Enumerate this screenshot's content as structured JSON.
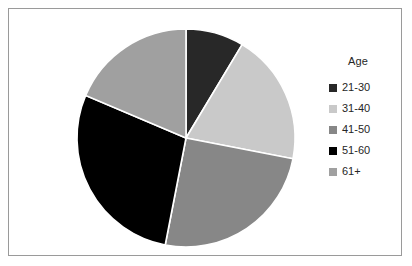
{
  "chart_data": {
    "type": "pie",
    "title": "",
    "legend_title": "Age",
    "legend_position": "right",
    "grid": false,
    "categories": [
      "21-30",
      "31-40",
      "41-50",
      "51-60",
      "61+"
    ],
    "values": [
      8.6,
      19.4,
      25.0,
      28.4,
      18.6
    ],
    "value_unit": "percent",
    "angles_deg": [
      31,
      70,
      90,
      102,
      67
    ],
    "start_angle_deg": 0,
    "direction": "clockwise",
    "colors": [
      "#282828",
      "#c9c9c9",
      "#878787",
      "#000000",
      "#a0a0a0"
    ],
    "xlabel": "",
    "ylabel": ""
  },
  "frame": {
    "border_color": "#9a9a9a",
    "background": "#ffffff"
  }
}
